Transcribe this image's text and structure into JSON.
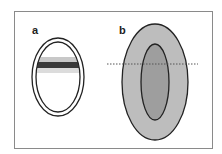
{
  "panels": {
    "a": {
      "label": "a"
    },
    "b": {
      "label": "b"
    }
  },
  "colors": {
    "frame": "#8a8a8a",
    "outline": "#222222",
    "band_light": "#c8c8c8",
    "band_dark": "#3a3a3a",
    "band_pale": "#dcdcdc",
    "outer_fill": "#bdbdbd",
    "inner_fill": "#9e9e9e"
  }
}
